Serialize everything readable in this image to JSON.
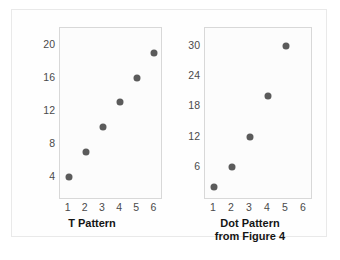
{
  "figure": {
    "background_color": "#fefefe",
    "frame_color": "#e9e9e9",
    "dot_color": "#5b5b5b",
    "axis_color": "#d8d8d8",
    "tick_text_color": "#4a4a4a"
  },
  "chart_data": [
    {
      "type": "scatter",
      "title": "T Pattern",
      "title_lines": [
        "T Pattern"
      ],
      "xlabel": "",
      "ylabel": "",
      "x": [
        1,
        2,
        3,
        4,
        5,
        6
      ],
      "y": [
        4,
        7,
        10,
        13,
        16,
        19
      ],
      "xticks": [
        "1",
        "2",
        "3",
        "4",
        "5",
        "6"
      ],
      "yticks": [
        "4",
        "8",
        "12",
        "16",
        "20"
      ],
      "ytick_values": [
        4,
        8,
        12,
        16,
        20
      ],
      "xlim": [
        0.5,
        6.5
      ],
      "ylim": [
        1.2,
        22.0
      ],
      "grid": false,
      "legend": "none"
    },
    {
      "type": "scatter",
      "title": "Dot Pattern from Figure 4",
      "title_lines": [
        "Dot Pattern",
        "from Figure 4"
      ],
      "xlabel": "",
      "ylabel": "",
      "x": [
        1,
        2,
        3,
        4,
        5
      ],
      "y": [
        2,
        6,
        12,
        20,
        30
      ],
      "xticks": [
        "1",
        "2",
        "3",
        "4",
        "5",
        "6"
      ],
      "yticks": [
        "6",
        "12",
        "18",
        "24",
        "30"
      ],
      "ytick_values": [
        6,
        12,
        18,
        24,
        30
      ],
      "xlim": [
        0.5,
        6.5
      ],
      "ylim": [
        -0.5,
        33.5
      ],
      "grid": false,
      "legend": "none"
    }
  ]
}
